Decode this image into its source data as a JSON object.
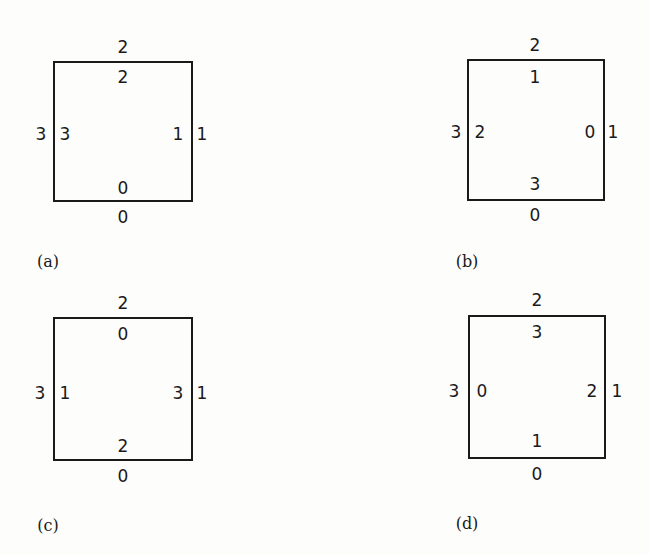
{
  "figure": {
    "panels": [
      {
        "id": "a",
        "caption": "(a)",
        "outer": {
          "top": "2",
          "right": "1",
          "bottom": "0",
          "left": "3"
        },
        "inner": {
          "top": "2",
          "right": "1",
          "bottom": "0",
          "left": "3"
        }
      },
      {
        "id": "b",
        "caption": "(b)",
        "outer": {
          "top": "2",
          "right": "1",
          "bottom": "0",
          "left": "3"
        },
        "inner": {
          "top": "1",
          "right": "0",
          "bottom": "3",
          "left": "2"
        }
      },
      {
        "id": "c",
        "caption": "(c)",
        "outer": {
          "top": "2",
          "right": "1",
          "bottom": "0",
          "left": "3"
        },
        "inner": {
          "top": "0",
          "right": "3",
          "bottom": "2",
          "left": "1"
        }
      },
      {
        "id": "d",
        "caption": "(d)",
        "outer": {
          "top": "2",
          "right": "1",
          "bottom": "0",
          "left": "3"
        },
        "inner": {
          "top": "3",
          "right": "2",
          "bottom": "1",
          "left": "0"
        }
      }
    ]
  }
}
